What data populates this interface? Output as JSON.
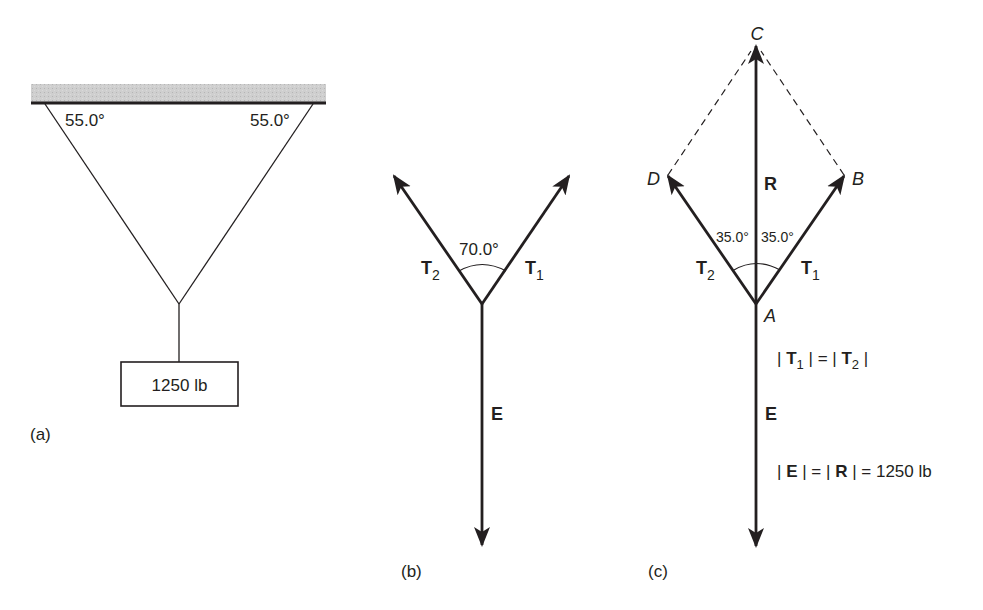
{
  "colors": {
    "ink": "#231f20",
    "ceiling_fill": "#c8c8c8",
    "background": "#ffffff"
  },
  "panel_a": {
    "caption": "(a)",
    "left_angle": "55.0°",
    "right_angle": "55.0°",
    "weight_label": "1250 lb"
  },
  "panel_b": {
    "caption": "(b)",
    "angle_label": "70.0°",
    "t2": {
      "base": "T",
      "sub": "2"
    },
    "t1": {
      "base": "T",
      "sub": "1"
    },
    "e_label": "E"
  },
  "panel_c": {
    "caption": "(c)",
    "points": {
      "C": "C",
      "D": "D",
      "B": "B",
      "A": "A"
    },
    "r_label": "R",
    "left_angle": "35.0°",
    "right_angle": "35.0°",
    "t2": {
      "base": "T",
      "sub": "2"
    },
    "t1": {
      "base": "T",
      "sub": "1"
    },
    "e_label": "E",
    "eq1": {
      "left_base": "T",
      "left_sub": "1",
      "right_base": "T",
      "right_sub": "2"
    },
    "eq2": {
      "e": "E",
      "r": "R",
      "value": "1250 lb"
    }
  }
}
